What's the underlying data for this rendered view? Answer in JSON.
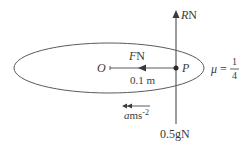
{
  "diagram": {
    "type": "force-diagram",
    "colors": {
      "stroke": "#5a5a5a",
      "text": "#3a3a3a",
      "background": "#ffffff"
    },
    "labels": {
      "reaction_var": "R",
      "reaction_unit": "N",
      "friction_var": "F",
      "friction_unit": "N",
      "centre": "O",
      "particle": "P",
      "radius": "0.1 m",
      "mu_symbol": "μ",
      "mu_equals": "=",
      "mu_numerator": "1",
      "mu_denominator": "4",
      "accel_var": "a",
      "accel_unit": "ms",
      "accel_exp": "-2",
      "weight": "0.5gN"
    }
  }
}
